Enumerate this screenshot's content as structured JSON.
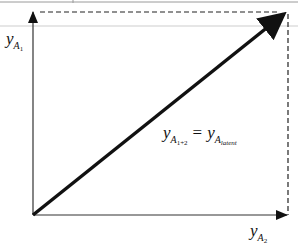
{
  "diagram": {
    "y_axis_label": {
      "var": "y",
      "sub": "A",
      "subsub": "1"
    },
    "x_axis_label": {
      "var": "y",
      "sub": "A",
      "subsub": "2"
    },
    "equation": {
      "lhs": {
        "var": "y",
        "sub": "A",
        "subsub": "1+2"
      },
      "op": "=",
      "rhs": {
        "var": "y",
        "sub": "A",
        "subsub": "latent"
      }
    },
    "colors": {
      "stroke": "#111111",
      "axis": "#333333",
      "top_rule": "#9a9a9a",
      "faint_band": "#e6e6e6"
    }
  }
}
